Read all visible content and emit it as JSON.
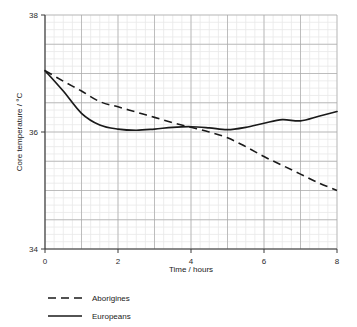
{
  "chart_data": {
    "type": "line",
    "title": "",
    "subtitle": "",
    "xlabel": "Time / hours",
    "ylabel": "Core temperature / °C",
    "xlim": [
      0,
      8
    ],
    "ylim": [
      34,
      38
    ],
    "xticks": [
      0,
      2,
      4,
      6,
      8
    ],
    "xtick_labels": [
      "0",
      "2",
      "4",
      "6",
      "8"
    ],
    "yticks": [
      34,
      36,
      38
    ],
    "ytick_labels": [
      "34",
      "36",
      "38"
    ],
    "grid": true,
    "grid_major_x": 1,
    "grid_major_y": 0.5,
    "grid_minor_x": 0.25,
    "grid_minor_y": 0.125,
    "legend_position": "below-left",
    "x": [
      0,
      0.5,
      1,
      1.5,
      2,
      2.5,
      3,
      3.5,
      4,
      4.5,
      5,
      5.5,
      6,
      6.5,
      7,
      7.5,
      8
    ],
    "series": [
      {
        "name": "Aborigines",
        "style": "dashed",
        "color": "#1a1a1a",
        "values": [
          37.05,
          36.87,
          36.7,
          36.52,
          36.43,
          36.34,
          36.25,
          36.16,
          36.08,
          36.0,
          35.9,
          35.75,
          35.58,
          35.43,
          35.28,
          35.13,
          35.0
        ]
      },
      {
        "name": "Europeans",
        "style": "solid",
        "color": "#1a1a1a",
        "values": [
          37.05,
          36.7,
          36.32,
          36.12,
          36.05,
          36.03,
          36.05,
          36.08,
          36.09,
          36.07,
          36.04,
          36.08,
          36.15,
          36.21,
          36.19,
          36.27,
          36.35
        ]
      }
    ]
  },
  "legend": {
    "items": [
      {
        "label": "Aborigines",
        "style": "dashed"
      },
      {
        "label": "Europeans",
        "style": "solid"
      }
    ]
  },
  "axes": {
    "x_title": "Time / hours",
    "y_title": "Core temperature / °C"
  },
  "colors": {
    "line": "#1a1a1a",
    "grid_major": "#a8a8a8",
    "grid_minor": "#e9e9e9",
    "axis": "#3a3a3a",
    "background": "#ffffff"
  }
}
